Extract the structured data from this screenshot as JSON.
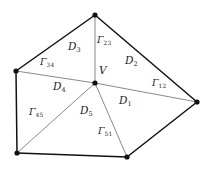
{
  "figure": {
    "kind": "geometry-diagram",
    "stroke_color": "#1a1a1a",
    "boundary_stroke_color": "#111111",
    "interior_stroke_color": "#8a8a8a",
    "vertex_color": "#111111",
    "background_color": "#ffffff",
    "center_vertex": {
      "name": "V",
      "label": "V",
      "x": 95,
      "y": 83,
      "label_x": 99,
      "label_y": 70
    },
    "outer_vertices": [
      {
        "name": "vertex-top",
        "x": 95,
        "y": 15
      },
      {
        "name": "vertex-right",
        "x": 197,
        "y": 102
      },
      {
        "name": "vertex-bottom-right",
        "x": 127,
        "y": 157
      },
      {
        "name": "vertex-bottom-left",
        "x": 17,
        "y": 153
      },
      {
        "name": "vertex-left",
        "x": 16,
        "y": 71
      }
    ],
    "boundary_edges": [
      {
        "name": "edge-gamma-12",
        "label_base": "Γ",
        "label_sub": "12",
        "from": "vertex-top",
        "to": "vertex-right",
        "label_x": 152,
        "label_y": 83
      },
      {
        "name": "edge-gamma-23",
        "label_base": "Γ",
        "label_sub": "23",
        "from": "vertex-right",
        "to": "vertex-bottom-right",
        "label_x": 97,
        "label_y": 40
      },
      {
        "name": "edge-gamma-34",
        "label_base": "Γ",
        "label_sub": "34",
        "from": "vertex-bottom-right",
        "to": "vertex-bottom-left",
        "label_x": 40,
        "label_y": 62
      },
      {
        "name": "edge-gamma-45",
        "label_base": "Γ",
        "label_sub": "45",
        "from": "vertex-bottom-left",
        "to": "vertex-left",
        "label_x": 29,
        "label_y": 112
      },
      {
        "name": "edge-gamma-51",
        "label_base": "Γ",
        "label_sub": "51",
        "from": "vertex-left",
        "to": "vertex-top",
        "label_x": 98,
        "label_y": 131
      }
    ],
    "subdomains": [
      {
        "name": "subdomain-d1",
        "label_base": "D",
        "label_sub": "1",
        "label_x": 119,
        "label_y": 100
      },
      {
        "name": "subdomain-d2",
        "label_base": "D",
        "label_sub": "2",
        "label_x": 125,
        "label_y": 60
      },
      {
        "name": "subdomain-d3",
        "label_base": "D",
        "label_sub": "3",
        "label_x": 68,
        "label_y": 46
      },
      {
        "name": "subdomain-d4",
        "label_base": "D",
        "label_sub": "4",
        "label_x": 53,
        "label_y": 86
      },
      {
        "name": "subdomain-d5",
        "label_base": "D",
        "label_sub": "5",
        "label_x": 80,
        "label_y": 110
      }
    ]
  }
}
